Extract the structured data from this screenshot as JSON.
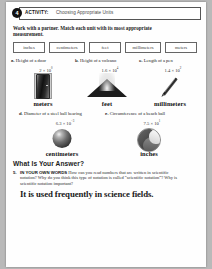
{
  "activity": {
    "number": "4",
    "label": "ACTIVITY:",
    "title": "Choosing Appropriate Units",
    "directions": "Work with a partner. Match each unit with its most appropriate measurement."
  },
  "unit_chips": [
    {
      "label": "inches"
    },
    {
      "label": "centimeters"
    },
    {
      "label": "feet"
    },
    {
      "label": "millimeters"
    },
    {
      "label": "meters"
    }
  ],
  "problems_row1": [
    {
      "letter": "a.",
      "text": "Height of a door",
      "mantissa": "2 × 10",
      "exponent": "0",
      "icon": "door-icon",
      "answer": "meters"
    },
    {
      "letter": "b.",
      "text": "Height of a volcano",
      "mantissa": "1.6 × 10",
      "exponent": "4",
      "icon": "volcano-icon",
      "answer": "feet"
    },
    {
      "letter": "c.",
      "text": "Length of a pen",
      "mantissa": "1.4 × 10",
      "exponent": "2",
      "icon": "pen-icon",
      "answer": "millimeters"
    }
  ],
  "problems_row2": [
    {
      "letter": "d.",
      "text": "Diameter of a steel ball bearing",
      "mantissa": "6.3 × 10",
      "exponent": "−3",
      "icon": "steel-ball-icon",
      "answer": "centimeters"
    },
    {
      "letter": "e.",
      "text": "Circumference of a beach ball",
      "mantissa": "7.5 × 10",
      "exponent": "1",
      "icon": "beach-ball-icon",
      "answer": "inches"
    }
  ],
  "what_is_your_answer": {
    "heading": "What Is Your Answer?",
    "question_number": "5.",
    "question_prompt": "IN YOUR OWN WORDS",
    "question_text": " How can you read numbers that are written in scientific notation? Why do you think this type of notation is called “scientific notation”? Why is scientific notation important?",
    "student_answer": "It is used frequently in science fields."
  }
}
